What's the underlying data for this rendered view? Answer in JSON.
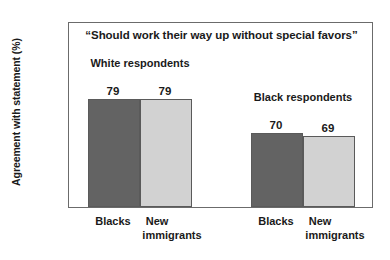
{
  "chart_data": {
    "type": "bar",
    "title": "“Should work their way up without special favors”",
    "xlabel": "",
    "ylabel": "Agreement with statement (%)",
    "ylim": [
      50,
      100
    ],
    "ytick_labels": [
      "100",
      "90",
      "80",
      "70",
      "60",
      "50"
    ],
    "ytick_values": [
      100,
      90,
      80,
      70,
      60,
      50
    ],
    "yminor_values": [
      95,
      85,
      75,
      65,
      55
    ],
    "grid": false,
    "legend": "none",
    "categories": [
      "Blacks",
      "New immigrants"
    ],
    "groups": [
      {
        "name": "White respondents",
        "label_line1": "White",
        "label_line2": "respondents",
        "bars": [
          {
            "category": "Blacks",
            "category_line1": "Blacks",
            "category_line2": "",
            "value": 79,
            "value_label": "79",
            "color": "#636363"
          },
          {
            "category": "New immigrants",
            "category_line1": "New",
            "category_line2": "immigrants",
            "value": 79,
            "value_label": "79",
            "color": "#d2d2d2"
          }
        ]
      },
      {
        "name": "Black respondents",
        "label_line1": "Black",
        "label_line2": "respondents",
        "bars": [
          {
            "category": "Blacks",
            "category_line1": "Blacks",
            "category_line2": "",
            "value": 70,
            "value_label": "70",
            "color": "#636363"
          },
          {
            "category": "New immigrants",
            "category_line1": "New",
            "category_line2": "immigrants",
            "value": 69,
            "value_label": "69",
            "color": "#d2d2d2"
          }
        ]
      }
    ],
    "series": [
      {
        "name": "Blacks",
        "values": [
          79,
          70
        ],
        "color": "#636363"
      },
      {
        "name": "New immigrants",
        "values": [
          79,
          69
        ],
        "color": "#d2d2d2"
      }
    ],
    "colors": {
      "dark_bar": "#636363",
      "light_bar": "#d2d2d2",
      "bar_outline": "#5a5a5a",
      "axis": "#6b6b6b",
      "text": "#1a1a1a",
      "background": "#ffffff"
    }
  }
}
